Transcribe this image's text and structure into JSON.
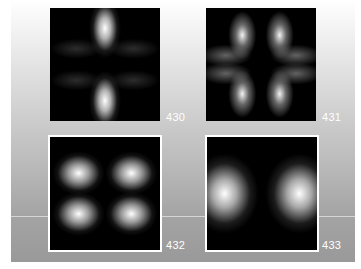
{
  "figure": {
    "panels": [
      {
        "id": "430",
        "label": "430",
        "pattern": "two vertical lobes with four faint diagonal side lobes"
      },
      {
        "id": "431",
        "label": "431",
        "pattern": "six-petal star pattern"
      },
      {
        "id": "432",
        "label": "432",
        "pattern": "four quadrant lobes"
      },
      {
        "id": "433",
        "label": "433",
        "pattern": "two horizontal lobes"
      }
    ],
    "colors": {
      "background_top": "#ffffff",
      "background_bottom": "#999999",
      "tile_background": "#000000",
      "label_color": "#ffffff",
      "border_color": "#ffffff"
    }
  }
}
